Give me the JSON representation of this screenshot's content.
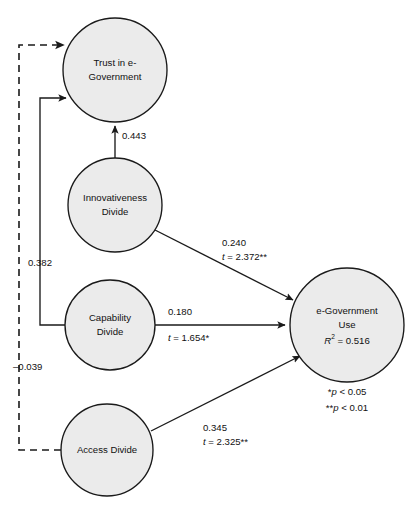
{
  "diagram": {
    "type": "structural-equation-model-path-diagram",
    "background_color": "#ffffff",
    "node_fill_color": "#ebebeb",
    "line_color": "#1a1a1a",
    "nodes": [
      {
        "id": "trust",
        "label_line1": "Trust in e-",
        "label_line2": "Government",
        "cx": 115,
        "cy": 70,
        "r": 52
      },
      {
        "id": "innovativeness",
        "label_line1": "Innovativeness",
        "label_line2": "Divide",
        "cx": 115,
        "cy": 205,
        "r": 47
      },
      {
        "id": "capability",
        "label_line1": "Capability",
        "label_line2": "Divide",
        "cx": 110,
        "cy": 325,
        "r": 45
      },
      {
        "id": "access",
        "label_line1": "Access Divide",
        "label_line2": "",
        "cx": 107,
        "cy": 450,
        "r": 46
      },
      {
        "id": "egov_use",
        "label_line1": "e-Government",
        "label_line2": "Use",
        "label_line3_prefix": "R",
        "label_line3_sup": "2",
        "label_line3_suffix": " = 0.516",
        "cx": 347,
        "cy": 325,
        "r": 57
      }
    ],
    "edges": [
      {
        "id": "innovativeness-to-trust",
        "from": "innovativeness",
        "to": "trust",
        "style": "solid",
        "coefficient": "0.443",
        "t_value": "",
        "label_x": 122,
        "label_y": 136
      },
      {
        "id": "innovativeness-to-egov-use",
        "from": "innovativeness",
        "to": "egov_use",
        "style": "solid",
        "coefficient": "0.240",
        "t_statistic_prefix": "t",
        "t_statistic_value": " = 2.372**",
        "label_x": 222,
        "label_y": 243
      },
      {
        "id": "capability-to-egov-use",
        "from": "capability",
        "to": "egov_use",
        "style": "solid",
        "coefficient": "0.180",
        "t_statistic_prefix": "t",
        "t_statistic_value": " = 1.654*",
        "label_x": 168,
        "label_y": 312
      },
      {
        "id": "access-to-egov-use",
        "from": "access",
        "to": "egov_use",
        "style": "solid",
        "coefficient": "0.345",
        "t_statistic_prefix": "t",
        "t_statistic_value": " = 2.325**",
        "label_x": 203,
        "label_y": 428
      },
      {
        "id": "capability-to-trust",
        "from": "capability",
        "to": "trust",
        "style": "solid",
        "coefficient": "0.382",
        "t_value": "",
        "label_x": 28,
        "label_y": 263
      },
      {
        "id": "access-to-trust",
        "from": "access",
        "to": "trust",
        "style": "dashed",
        "coefficient": "–0.039",
        "t_value": "",
        "label_x": 13,
        "label_y": 367
      }
    ],
    "legend": {
      "line1_stars": "*",
      "line1_text_italic": "p",
      "line1_text_rest": " < 0.05",
      "line2_stars": "**",
      "line2_text_italic": "p",
      "line2_text_rest": " < 0.01",
      "line1_full": "*p < 0.05",
      "line2_full": "**p < 0.01",
      "x": 347,
      "y1": 392,
      "y2": 408
    }
  }
}
